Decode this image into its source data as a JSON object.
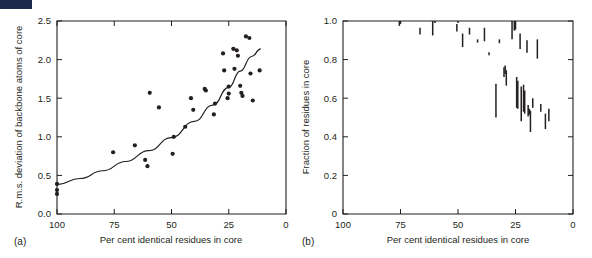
{
  "figure": {
    "panel_labels": {
      "a": "(a)",
      "b": "(b)"
    },
    "corner_mark_color": "#1b2a4a",
    "ink_color": "#231f20"
  },
  "chart_data": [
    {
      "id": "panel-a",
      "type": "scatter",
      "title": "",
      "panel_label": "(a)",
      "xlabel": "Per cent identical residues in core",
      "ylabel": "R.m.s. deviation of backbone atoms of core",
      "xlim": [
        100,
        0
      ],
      "ylim": [
        0.0,
        2.5
      ],
      "x_ticks": [
        100,
        75,
        50,
        25,
        0
      ],
      "x_tick_labels": [
        "100",
        "75",
        "50",
        "25",
        "0"
      ],
      "y_ticks": [
        0.0,
        0.5,
        1.0,
        1.5,
        2.0,
        2.5
      ],
      "y_tick_labels": [
        "0.0",
        "0.5",
        "1.0",
        "1.5",
        "2.0",
        "2.5"
      ],
      "grid": false,
      "legend": "none",
      "x_axis_reversed": true,
      "points": [
        [
          100,
          0.39
        ],
        [
          100,
          0.31
        ],
        [
          100,
          0.26
        ],
        [
          75.5,
          0.8
        ],
        [
          66.0,
          0.89
        ],
        [
          61.5,
          0.7
        ],
        [
          60.5,
          0.62
        ],
        [
          59.5,
          1.57
        ],
        [
          55.5,
          1.38
        ],
        [
          49.5,
          0.78
        ],
        [
          49.0,
          1.0
        ],
        [
          44.0,
          1.13
        ],
        [
          41.5,
          1.5
        ],
        [
          40.5,
          1.35
        ],
        [
          35.5,
          1.62
        ],
        [
          35.0,
          1.6
        ],
        [
          31.5,
          1.29
        ],
        [
          31.0,
          1.43
        ],
        [
          27.5,
          2.08
        ],
        [
          27.0,
          1.86
        ],
        [
          25.5,
          1.5
        ],
        [
          25.0,
          1.65
        ],
        [
          25.0,
          1.56
        ],
        [
          23.0,
          2.14
        ],
        [
          22.5,
          1.88
        ],
        [
          21.5,
          2.12
        ],
        [
          21.0,
          2.05
        ],
        [
          20.0,
          1.66
        ],
        [
          19.5,
          1.57
        ],
        [
          19.0,
          1.53
        ],
        [
          17.5,
          2.3
        ],
        [
          16.0,
          2.28
        ],
        [
          15.5,
          1.82
        ],
        [
          14.5,
          1.47
        ],
        [
          11.5,
          1.86
        ]
      ],
      "trend_curve": {
        "description": "monotonic rising exponential fit",
        "points": [
          [
            100,
            0.38
          ],
          [
            90,
            0.46
          ],
          [
            80,
            0.56
          ],
          [
            70,
            0.68
          ],
          [
            60,
            0.82
          ],
          [
            50,
            0.99
          ],
          [
            40,
            1.2
          ],
          [
            32,
            1.41
          ],
          [
            25,
            1.64
          ],
          [
            20,
            1.85
          ],
          [
            15,
            2.04
          ],
          [
            11,
            2.14
          ]
        ]
      }
    },
    {
      "id": "panel-b",
      "type": "bar",
      "title": "",
      "panel_label": "(b)",
      "xlabel": "Per cent identical residues in core",
      "ylabel": "Fraction of residues in core",
      "xlim": [
        100,
        0
      ],
      "ylim": [
        0.0,
        1.0
      ],
      "x_ticks": [
        100,
        75,
        50,
        25,
        0
      ],
      "x_tick_labels": [
        "100",
        "75",
        "50",
        "25",
        "0"
      ],
      "y_ticks": [
        0.0,
        0.2,
        0.4,
        0.6,
        0.8,
        1.0
      ],
      "y_tick_labels": [
        "0",
        "0.2",
        "0.4",
        "0.6",
        "0.8",
        "1.0"
      ],
      "grid": false,
      "legend": "none",
      "x_axis_reversed": true,
      "bars_note": "each datum is a vertical range bar (low to high fraction) at a given per cent identity",
      "bars": [
        [
          75.5,
          0.975,
          1.0
        ],
        [
          75.0,
          0.985,
          1.0
        ],
        [
          66.5,
          0.93,
          0.965
        ],
        [
          61.0,
          0.925,
          1.0
        ],
        [
          60.0,
          0.99,
          1.0
        ],
        [
          50.5,
          0.945,
          0.985
        ],
        [
          50.0,
          0.99,
          1.0
        ],
        [
          48.0,
          0.865,
          0.935
        ],
        [
          45.0,
          0.93,
          0.965
        ],
        [
          41.5,
          0.888,
          0.905
        ],
        [
          38.5,
          0.895,
          0.965
        ],
        [
          36.5,
          0.823,
          0.838
        ],
        [
          32.0,
          0.885,
          0.905
        ],
        [
          30.0,
          0.71,
          0.76
        ],
        [
          29.5,
          0.725,
          0.77
        ],
        [
          29.0,
          0.665,
          0.745
        ],
        [
          33.5,
          0.5,
          0.675
        ],
        [
          26.5,
          0.905,
          1.0
        ],
        [
          25.5,
          0.95,
          1.0
        ],
        [
          25.0,
          0.955,
          1.0
        ],
        [
          24.5,
          0.55,
          0.71
        ],
        [
          24.0,
          0.545,
          0.69
        ],
        [
          23.0,
          0.855,
          0.935
        ],
        [
          22.5,
          0.48,
          0.66
        ],
        [
          21.5,
          0.53,
          0.67
        ],
        [
          21.0,
          0.52,
          0.64
        ],
        [
          20.0,
          0.835,
          0.9
        ],
        [
          19.5,
          0.505,
          0.565
        ],
        [
          19.0,
          0.515,
          0.545
        ],
        [
          18.5,
          0.425,
          0.535
        ],
        [
          17.5,
          0.55,
          0.6
        ],
        [
          15.5,
          0.805,
          0.905
        ],
        [
          14.0,
          0.53,
          0.57
        ],
        [
          12.0,
          0.44,
          0.52
        ],
        [
          10.5,
          0.48,
          0.545
        ]
      ]
    }
  ]
}
